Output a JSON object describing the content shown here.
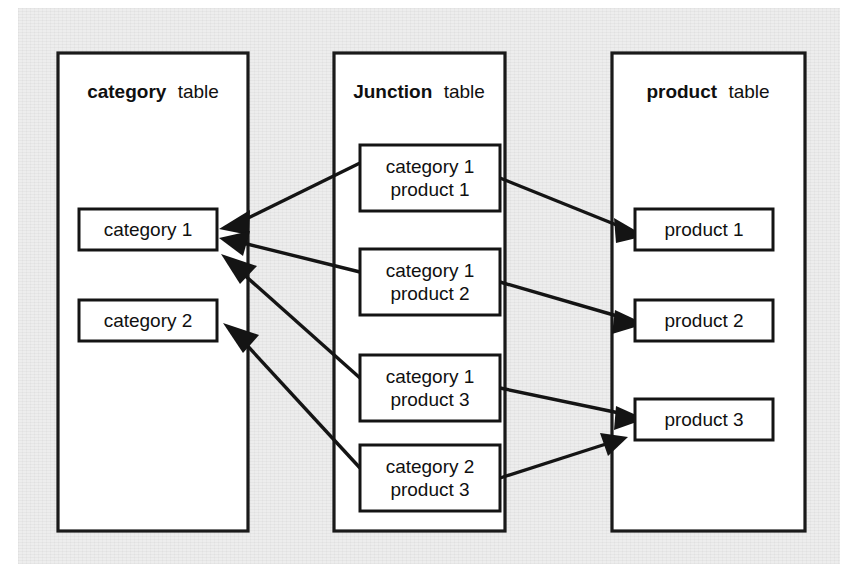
{
  "diagram": {
    "title_note": "many-to-many relationship via junction table",
    "background_color": "#ededed",
    "line_color": "#141414",
    "box_fill": "#ffffff",
    "panels": [
      {
        "id": "category",
        "title_strong": "category",
        "title_light": "table",
        "entities": [
          {
            "id": "category-1",
            "label": "category 1"
          },
          {
            "id": "category-2",
            "label": "category 2"
          }
        ]
      },
      {
        "id": "junction",
        "title_strong": "Junction",
        "title_light": "table",
        "entities": [
          {
            "id": "junction-row-1",
            "line1": "category 1",
            "line2": "product 1"
          },
          {
            "id": "junction-row-2",
            "line1": "category 1",
            "line2": "product 2"
          },
          {
            "id": "junction-row-3",
            "line1": "category 1",
            "line2": "product 3"
          },
          {
            "id": "junction-row-4",
            "line1": "category 2",
            "line2": "product 3"
          }
        ]
      },
      {
        "id": "product",
        "title_strong": "product",
        "title_light": "table",
        "entities": [
          {
            "id": "product-1",
            "label": "product 1"
          },
          {
            "id": "product-2",
            "label": "product 2"
          },
          {
            "id": "product-3",
            "label": "product 3"
          }
        ]
      }
    ],
    "relationships": [
      {
        "id": "rel-j1-category-1",
        "from": "junction-row-1",
        "to": "category-1"
      },
      {
        "id": "rel-j1-product-1",
        "from": "junction-row-1",
        "to": "product-1"
      },
      {
        "id": "rel-j2-category-1",
        "from": "junction-row-2",
        "to": "category-1"
      },
      {
        "id": "rel-j2-product-2",
        "from": "junction-row-2",
        "to": "product-2"
      },
      {
        "id": "rel-j3-category-1",
        "from": "junction-row-3",
        "to": "category-1"
      },
      {
        "id": "rel-j3-product-3",
        "from": "junction-row-3",
        "to": "product-3"
      },
      {
        "id": "rel-j4-category-2",
        "from": "junction-row-4",
        "to": "category-2"
      },
      {
        "id": "rel-j4-product-3",
        "from": "junction-row-4",
        "to": "product-3"
      }
    ]
  }
}
